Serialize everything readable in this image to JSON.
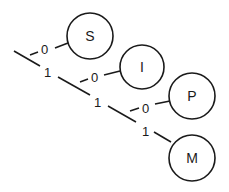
{
  "diagram": {
    "type": "code-tree",
    "nodes": [
      {
        "id": "S",
        "label": "S"
      },
      {
        "id": "I",
        "label": "I"
      },
      {
        "id": "P",
        "label": "P"
      },
      {
        "id": "M",
        "label": "M"
      }
    ],
    "edges": [
      {
        "label": "0",
        "to": "S"
      },
      {
        "label": "1",
        "to": "branch-2"
      },
      {
        "label": "0",
        "to": "I"
      },
      {
        "label": "1",
        "to": "branch-3"
      },
      {
        "label": "0",
        "to": "P"
      },
      {
        "label": "1",
        "to": "M"
      }
    ]
  }
}
